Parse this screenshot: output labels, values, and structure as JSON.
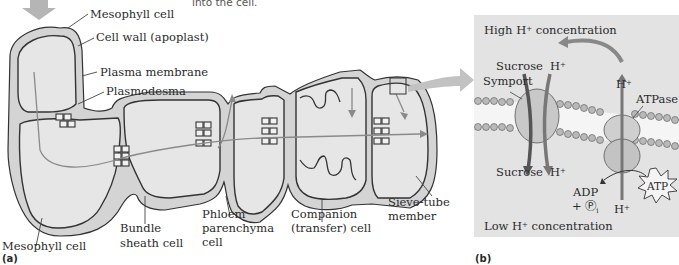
{
  "top_note": "into the cell.",
  "panel_a": {
    "tag": "(a)",
    "labels": {
      "mesophyll_top": "Mesophyll cell",
      "cell_wall": "Cell wall (apoplast)",
      "plasma_membrane": "Plasma membrane",
      "plasmodesma": "Plasmodesma",
      "mesophyll_bottom": "Mesophyll cell",
      "bundle_sheath_1": "Bundle",
      "bundle_sheath_2": "sheath cell",
      "phloem_1": "Phloem",
      "phloem_2": "parenchyma",
      "phloem_3": "cell",
      "companion_1": "Companion",
      "companion_2": "(transfer) cell",
      "sieve_1": "Sieve-tube",
      "sieve_2": "member"
    }
  },
  "panel_b": {
    "tag": "(b)",
    "high_label": "High H",
    "high_suffix": " concentration",
    "low_label": "Low H",
    "low_suffix": " concentration",
    "sup_plus": "+",
    "sucrose_top": "Sucrose",
    "h_top": "H",
    "symport": "Symport",
    "h_atpase_top": "H",
    "atpase": "ATPase",
    "sucrose_bottom": "Sucrose",
    "h_bottom": "H",
    "adp": "ADP",
    "pi": "+ Ⓟ",
    "pi_sub": "i",
    "atp": "ATP",
    "h_atpase_bottom": "H"
  },
  "colors": {
    "cell_fill": "#e4e4e4",
    "wall_fill": "#d2d2d2",
    "outline": "#333333",
    "arrow_gray": "#9a9a9a",
    "panel_bg": "#e3e3e3"
  }
}
